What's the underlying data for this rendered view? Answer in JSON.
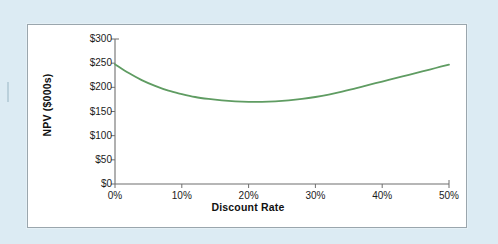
{
  "figure": {
    "background_color": "#dcebf3",
    "panel_background": "#ffffff",
    "panel_border_color": "#9aa6ad"
  },
  "chart_data": {
    "type": "line",
    "title": "",
    "subtitle": "",
    "xlabel": "Discount Rate",
    "ylabel": "NPV ($000s)",
    "xlim": [
      0,
      50
    ],
    "ylim": [
      0,
      300
    ],
    "xticks": [
      0,
      10,
      20,
      30,
      40,
      50
    ],
    "xtick_labels": [
      "0%",
      "10%",
      "20%",
      "30%",
      "40%",
      "50%"
    ],
    "yticks": [
      0,
      50,
      100,
      150,
      200,
      250,
      300
    ],
    "ytick_labels": [
      "$0",
      "$50",
      "$100",
      "$150",
      "$200",
      "$250",
      "$300"
    ],
    "grid": false,
    "legend": false,
    "legend_position": "none",
    "series": [
      {
        "name": "NPV",
        "color": "#5f9c62",
        "line_width": 1.8,
        "x": [
          0,
          2,
          4,
          6,
          8,
          10,
          12,
          14,
          16,
          18,
          20,
          22,
          24,
          26,
          28,
          30,
          32,
          34,
          36,
          38,
          40,
          42,
          44,
          46,
          48,
          50
        ],
        "y": [
          248,
          230,
          215,
          203,
          193,
          186,
          180,
          176,
          173,
          171,
          170,
          170,
          171,
          173,
          176,
          180,
          185,
          191,
          198,
          205,
          212,
          219,
          226,
          233,
          240,
          247
        ]
      }
    ],
    "annotations": [],
    "notes": {
      "minimum_value": 170,
      "minimum_at": "20%",
      "start_value": 248,
      "end_value": 247
    }
  }
}
